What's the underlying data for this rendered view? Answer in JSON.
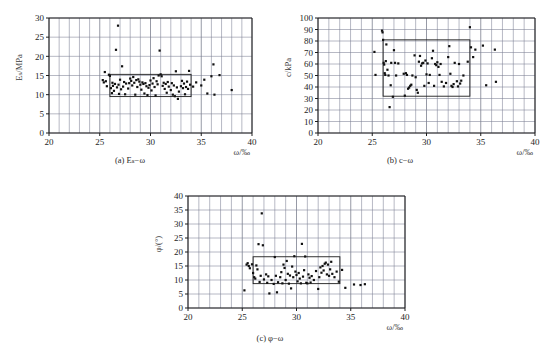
{
  "figure": {
    "panels": [
      {
        "id": "a",
        "caption": "(a) Eₛ−ω",
        "ylabel": "Eₛ/MPa",
        "xlabel": "ω/‰",
        "xticks": [
          "20",
          "25",
          "30",
          "35",
          "40"
        ],
        "yticks": [
          "0",
          "5",
          "10",
          "15",
          "20",
          "25",
          "30"
        ]
      },
      {
        "id": "b",
        "caption": "(b) c−ω",
        "ylabel": "c/kPa",
        "xlabel": "ω/‰",
        "xticks": [
          "20",
          "25",
          "30",
          "35",
          "40"
        ],
        "yticks": [
          "0",
          "10",
          "20",
          "30",
          "40",
          "50",
          "60",
          "70",
          "80",
          "90",
          "100"
        ]
      },
      {
        "id": "c",
        "caption": "(c) φ−ω",
        "ylabel": "φ/(°)",
        "xlabel": "ω/‰",
        "xticks": [
          "20",
          "25",
          "30",
          "35",
          "40"
        ],
        "yticks": [
          "0",
          "5",
          "10",
          "15",
          "20",
          "25",
          "30",
          "35",
          "40"
        ]
      }
    ]
  },
  "chart_data": [
    {
      "type": "scatter",
      "id": "a",
      "title": "(a) Eₛ−ω",
      "xlabel": "ω/‰",
      "ylabel": "Eₛ/MPa",
      "xlim": [
        20,
        40
      ],
      "ylim": [
        0,
        30
      ],
      "xtick_step": 5,
      "ytick_step": 5,
      "grid_x_step": 1,
      "grid_y_step": 5,
      "grid": true,
      "legend": "none",
      "annotation_box": {
        "x0": 26.0,
        "x1": 34.0,
        "y0": 9.5,
        "y1": 15.3
      },
      "points": [
        [
          25.3,
          13.8
        ],
        [
          25.4,
          13.2
        ],
        [
          25.5,
          15.9
        ],
        [
          25.6,
          13.5
        ],
        [
          25.7,
          12.2
        ],
        [
          25.9,
          15.2
        ],
        [
          26.0,
          14.9
        ],
        [
          26.1,
          11.7
        ],
        [
          26.2,
          10.4
        ],
        [
          26.25,
          13.1
        ],
        [
          26.3,
          12.3
        ],
        [
          26.4,
          11.0
        ],
        [
          26.5,
          12.8
        ],
        [
          26.6,
          21.7
        ],
        [
          26.7,
          11.9
        ],
        [
          26.8,
          28.0
        ],
        [
          26.85,
          12.6
        ],
        [
          26.9,
          10.2
        ],
        [
          27.0,
          13.9
        ],
        [
          27.1,
          11.4
        ],
        [
          27.2,
          17.4
        ],
        [
          27.3,
          12.1
        ],
        [
          27.4,
          13.3
        ],
        [
          27.5,
          10.1
        ],
        [
          27.6,
          12.9
        ],
        [
          27.8,
          11.6
        ],
        [
          27.9,
          13.0
        ],
        [
          28.0,
          14.2
        ],
        [
          28.1,
          13.6
        ],
        [
          28.2,
          12.4
        ],
        [
          28.3,
          14.6
        ],
        [
          28.4,
          13.1
        ],
        [
          28.5,
          10.0
        ],
        [
          28.6,
          13.8
        ],
        [
          28.7,
          12.0
        ],
        [
          28.8,
          14.0
        ],
        [
          28.9,
          13.4
        ],
        [
          29.0,
          12.6
        ],
        [
          29.1,
          11.3
        ],
        [
          29.2,
          13.2
        ],
        [
          29.3,
          12.8
        ],
        [
          29.4,
          10.3
        ],
        [
          29.5,
          13.0
        ],
        [
          29.6,
          12.2
        ],
        [
          29.7,
          9.9
        ],
        [
          29.8,
          11.8
        ],
        [
          29.9,
          12.5
        ],
        [
          30.0,
          13.7
        ],
        [
          30.1,
          11.1
        ],
        [
          30.2,
          12.9
        ],
        [
          30.3,
          14.3
        ],
        [
          30.4,
          12.0
        ],
        [
          30.5,
          9.8
        ],
        [
          30.6,
          13.5
        ],
        [
          30.7,
          12.7
        ],
        [
          30.8,
          15.0
        ],
        [
          30.9,
          21.5
        ],
        [
          31.0,
          15.3
        ],
        [
          31.1,
          14.8
        ],
        [
          31.2,
          12.3
        ],
        [
          31.3,
          13.1
        ],
        [
          31.4,
          11.5
        ],
        [
          31.5,
          12.8
        ],
        [
          31.6,
          10.5
        ],
        [
          31.7,
          13.3
        ],
        [
          31.8,
          12.1
        ],
        [
          32.0,
          11.2
        ],
        [
          32.1,
          13.0
        ],
        [
          32.2,
          10.0
        ],
        [
          32.3,
          12.4
        ],
        [
          32.4,
          9.6
        ],
        [
          32.5,
          16.1
        ],
        [
          32.6,
          11.9
        ],
        [
          32.7,
          8.9
        ],
        [
          32.8,
          10.8
        ],
        [
          33.0,
          12.2
        ],
        [
          33.1,
          13.6
        ],
        [
          33.2,
          11.7
        ],
        [
          33.3,
          12.9
        ],
        [
          33.4,
          10.1
        ],
        [
          33.5,
          12.0
        ],
        [
          33.6,
          13.4
        ],
        [
          33.7,
          11.5
        ],
        [
          33.8,
          16.2
        ],
        [
          33.9,
          12.6
        ],
        [
          34.2,
          12.1
        ],
        [
          34.5,
          13.2
        ],
        [
          35.0,
          12.4
        ],
        [
          35.3,
          13.9
        ],
        [
          35.6,
          10.3
        ],
        [
          36.0,
          14.8
        ],
        [
          36.2,
          17.9
        ],
        [
          36.3,
          10.0
        ],
        [
          36.8,
          15.1
        ],
        [
          38.0,
          11.2
        ]
      ]
    },
    {
      "type": "scatter",
      "id": "b",
      "title": "(b) c−ω",
      "xlabel": "ω/‰",
      "ylabel": "c/kPa",
      "xlim": [
        20,
        40
      ],
      "ylim": [
        0,
        100
      ],
      "xtick_step": 5,
      "ytick_step": 10,
      "grid_x_step": 1,
      "grid_y_step": 10,
      "grid": true,
      "legend": "none",
      "annotation_box": {
        "x0": 26.0,
        "x1": 34.0,
        "y0": 32.0,
        "y1": 81.0
      },
      "points": [
        [
          25.2,
          70.5
        ],
        [
          25.3,
          50.5
        ],
        [
          25.9,
          89.0
        ],
        [
          25.95,
          87.5
        ],
        [
          26.0,
          81.0
        ],
        [
          26.05,
          61.0
        ],
        [
          26.1,
          59.5
        ],
        [
          26.15,
          52.0
        ],
        [
          26.2,
          50.5
        ],
        [
          26.25,
          62.5
        ],
        [
          26.3,
          77.0
        ],
        [
          26.4,
          55.0
        ],
        [
          26.5,
          50.0
        ],
        [
          26.6,
          22.5
        ],
        [
          26.7,
          41.5
        ],
        [
          26.75,
          61.0
        ],
        [
          26.9,
          31.5
        ],
        [
          27.0,
          72.0
        ],
        [
          27.1,
          61.0
        ],
        [
          27.2,
          50.0
        ],
        [
          27.4,
          60.5
        ],
        [
          27.9,
          51.5
        ],
        [
          28.0,
          32.5
        ],
        [
          28.1,
          52.0
        ],
        [
          28.2,
          50.5
        ],
        [
          28.3,
          38.5
        ],
        [
          28.4,
          39.5
        ],
        [
          28.5,
          41.0
        ],
        [
          28.6,
          42.0
        ],
        [
          28.7,
          50.0
        ],
        [
          28.9,
          67.5
        ],
        [
          29.0,
          48.5
        ],
        [
          29.1,
          37.5
        ],
        [
          29.2,
          35.0
        ],
        [
          29.3,
          62.0
        ],
        [
          29.4,
          67.0
        ],
        [
          29.5,
          58.5
        ],
        [
          29.6,
          60.5
        ],
        [
          29.7,
          61.0
        ],
        [
          29.8,
          41.0
        ],
        [
          29.9,
          63.0
        ],
        [
          30.0,
          51.0
        ],
        [
          30.1,
          60.5
        ],
        [
          30.2,
          43.5
        ],
        [
          30.3,
          50.5
        ],
        [
          30.5,
          65.0
        ],
        [
          30.6,
          71.5
        ],
        [
          30.7,
          41.0
        ],
        [
          30.8,
          60.0
        ],
        [
          30.9,
          59.0
        ],
        [
          31.0,
          61.5
        ],
        [
          31.1,
          57.5
        ],
        [
          31.2,
          50.5
        ],
        [
          31.3,
          60.0
        ],
        [
          31.4,
          44.5
        ],
        [
          31.6,
          40.5
        ],
        [
          31.8,
          43.5
        ],
        [
          32.0,
          66.0
        ],
        [
          32.1,
          75.5
        ],
        [
          32.2,
          51.5
        ],
        [
          32.3,
          41.0
        ],
        [
          32.4,
          40.0
        ],
        [
          32.5,
          42.5
        ],
        [
          32.6,
          61.0
        ],
        [
          32.8,
          45.0
        ],
        [
          32.9,
          40.5
        ],
        [
          33.0,
          60.0
        ],
        [
          33.1,
          43.0
        ],
        [
          33.2,
          45.5
        ],
        [
          33.4,
          50.0
        ],
        [
          33.8,
          62.0
        ],
        [
          34.0,
          92.0
        ],
        [
          34.1,
          74.5
        ],
        [
          34.3,
          66.0
        ],
        [
          34.5,
          72.5
        ],
        [
          35.2,
          76.0
        ],
        [
          35.5,
          41.5
        ],
        [
          36.3,
          72.5
        ],
        [
          36.4,
          44.5
        ]
      ]
    },
    {
      "type": "scatter",
      "id": "c",
      "title": "(c) φ−ω",
      "xlabel": "ω/‰",
      "ylabel": "φ/(°)",
      "xlim": [
        20,
        40
      ],
      "ylim": [
        0,
        40
      ],
      "xtick_step": 5,
      "ytick_step": 5,
      "grid_x_step": 1,
      "grid_y_step": 5,
      "grid": true,
      "legend": "none",
      "annotation_box": {
        "x0": 26.0,
        "x1": 34.0,
        "y0": 8.7,
        "y1": 18.3
      },
      "points": [
        [
          25.2,
          6.3
        ],
        [
          25.4,
          15.5
        ],
        [
          25.5,
          16.0
        ],
        [
          25.6,
          15.0
        ],
        [
          25.7,
          14.2
        ],
        [
          25.9,
          15.6
        ],
        [
          26.0,
          12.5
        ],
        [
          26.1,
          11.0
        ],
        [
          26.2,
          10.5
        ],
        [
          26.3,
          15.2
        ],
        [
          26.4,
          13.8
        ],
        [
          26.5,
          22.8
        ],
        [
          26.6,
          9.3
        ],
        [
          26.7,
          11.5
        ],
        [
          26.8,
          33.8
        ],
        [
          26.9,
          22.4
        ],
        [
          27.0,
          10.2
        ],
        [
          27.2,
          12.0
        ],
        [
          27.3,
          9.0
        ],
        [
          27.4,
          11.3
        ],
        [
          27.5,
          5.2
        ],
        [
          27.7,
          10.0
        ],
        [
          27.9,
          8.6
        ],
        [
          28.0,
          18.2
        ],
        [
          28.1,
          11.5
        ],
        [
          28.2,
          5.6
        ],
        [
          28.3,
          9.2
        ],
        [
          28.5,
          11.0
        ],
        [
          28.6,
          12.8
        ],
        [
          28.7,
          8.8
        ],
        [
          28.8,
          15.5
        ],
        [
          28.9,
          14.3
        ],
        [
          29.0,
          10.0
        ],
        [
          29.1,
          16.8
        ],
        [
          29.2,
          12.2
        ],
        [
          29.3,
          8.7
        ],
        [
          29.4,
          11.6
        ],
        [
          29.5,
          7.0
        ],
        [
          29.6,
          14.8
        ],
        [
          29.7,
          11.0
        ],
        [
          29.8,
          18.5
        ],
        [
          29.9,
          13.0
        ],
        [
          30.0,
          11.8
        ],
        [
          30.1,
          9.5
        ],
        [
          30.2,
          12.5
        ],
        [
          30.3,
          10.5
        ],
        [
          30.4,
          8.8
        ],
        [
          30.5,
          22.9
        ],
        [
          30.6,
          11.2
        ],
        [
          30.7,
          13.5
        ],
        [
          30.8,
          18.4
        ],
        [
          30.9,
          9.0
        ],
        [
          31.0,
          8.8
        ],
        [
          31.1,
          12.0
        ],
        [
          31.2,
          10.8
        ],
        [
          31.3,
          9.1
        ],
        [
          31.4,
          11.4
        ],
        [
          31.6,
          10.0
        ],
        [
          31.8,
          13.2
        ],
        [
          32.0,
          6.8
        ],
        [
          32.1,
          11.0
        ],
        [
          32.2,
          14.5
        ],
        [
          32.3,
          12.6
        ],
        [
          32.4,
          15.0
        ],
        [
          32.5,
          13.4
        ],
        [
          32.6,
          15.8
        ],
        [
          32.7,
          16.2
        ],
        [
          32.8,
          12.0
        ],
        [
          32.9,
          15.5
        ],
        [
          33.0,
          11.5
        ],
        [
          33.1,
          13.8
        ],
        [
          33.2,
          16.5
        ],
        [
          33.3,
          12.2
        ],
        [
          33.5,
          11.0
        ],
        [
          33.7,
          13.0
        ],
        [
          33.9,
          9.4
        ],
        [
          34.2,
          13.6
        ],
        [
          34.5,
          7.2
        ],
        [
          35.3,
          8.4
        ],
        [
          35.9,
          8.2
        ],
        [
          36.3,
          8.5
        ]
      ]
    }
  ]
}
